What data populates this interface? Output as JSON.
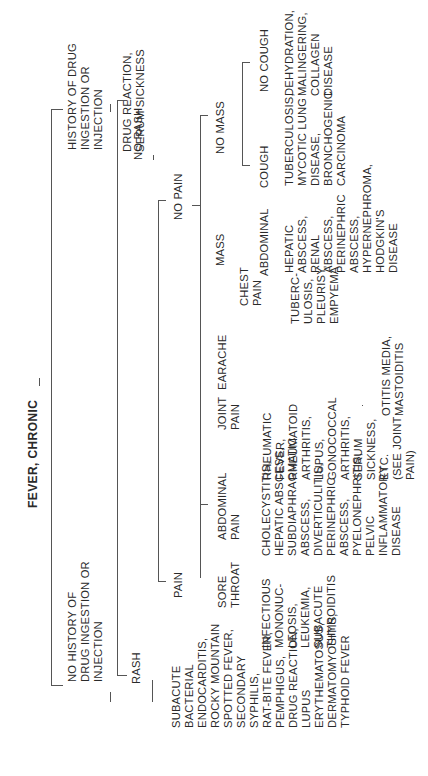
{
  "diagram": {
    "title": "FEVER, CHRONIC",
    "orientation": "rotated 90° counter-clockwise (tree reads left-to-right when page is turned)",
    "tree": {
      "label": "FEVER, CHRONIC",
      "children": [
        {
          "label": "HISTORY OF DRUG INGESTION OR INJECTION",
          "children": [
            {
              "label": "DRUG REACTION, SERUM SICKNESS"
            }
          ]
        },
        {
          "label": "NO HISTORY OF DRUG INGESTION OR INJECTION",
          "children": [
            {
              "label": "NO RASH",
              "children": [
                {
                  "label": "NO PAIN",
                  "children": [
                    {
                      "label": "NO MASS",
                      "children": [
                        {
                          "label": "NO COUGH",
                          "children": [
                            {
                              "label": "DEHYDRATION, MALINGERING, COLLAGEN DISEASE"
                            }
                          ]
                        },
                        {
                          "label": "COUGH",
                          "children": [
                            {
                              "label": "TUBERCULOSIS, MYCOTIC LUNG DISEASE, BRONCHOGENIC CARCINOMA"
                            }
                          ]
                        }
                      ]
                    },
                    {
                      "label": "MASS",
                      "children": [
                        {
                          "label": "ABDOMINAL",
                          "children": [
                            {
                              "label": "HEPATIC ABSCESS, RENAL ABSCESS, PERINEPHRIC ABSCESS, HYPERNEPHROMA, HODGKIN'S DISEASE"
                            }
                          ]
                        }
                      ]
                    }
                  ]
                },
                {
                  "label": "PAIN",
                  "children": [
                    {
                      "label": "CHEST PAIN",
                      "children": [
                        {
                          "label": "TUBERCULOSIS, PLEURISY, EMPYEMA"
                        }
                      ]
                    },
                    {
                      "label": "EARACHE",
                      "children": [
                        {
                          "label": "OTITIS MEDIA, MASTOIDITIS"
                        }
                      ]
                    },
                    {
                      "label": "JOINT PAIN",
                      "children": [
                        {
                          "label": "RHEUMATIC FEVER, RHEUMATOID ARTHRITIS, LUPUS, GONOCOCCAL ARTHRITIS, SERUM SICKNESS, ETC. (SEE JOINT PAIN)"
                        }
                      ]
                    },
                    {
                      "label": "ABDOMINAL PAIN",
                      "children": [
                        {
                          "label": "CHOLECYSTITIS, HEPATIC ABSCESS, SUBDIAPHRAGMATIC ABSCESS, DIVERTICULITIS, PERINEPHRIC ABSCESS, PYELONEPHRITIS, PELVIC INFLAMMATORY DISEASE"
                        }
                      ]
                    },
                    {
                      "label": "SORE THROAT",
                      "children": [
                        {
                          "label": "INFECTIOUS MONONUCLEOSIS, LEUKEMIA, SUBACUTE THYROIDITIS"
                        }
                      ]
                    }
                  ]
                }
              ]
            },
            {
              "label": "RASH",
              "children": [
                {
                  "label": "SUBACUTE BACTERIAL ENDOCARDITIS, ROCKY MOUNTAIN SPOTTED FEVER, SECONDARY SYPHILIS, RAT-BITE FEVER, PEMPHIGUS, DRUG REACTION, LUPUS ERYTHEMATOSUS, DERMATOMYOSITIS, TYPHOID FEVER"
                }
              ]
            }
          ]
        }
      ]
    }
  },
  "labels": {
    "root": "FEVER, CHRONIC",
    "history": "HISTORY OF DRUG\nINGESTION OR\nINJECTION",
    "history_dx": "DRUG REACTION,\nSERUM SICKNESS",
    "no_history": "NO HISTORY OF\nDRUG INGESTION OR\nINJECTION",
    "no_rash": "NO RASH",
    "rash": "RASH",
    "rash_dx": "SUBACUTE\nBACTERIAL\nENDOCARDITIS,\nROCKY MOUNTAIN\nSPOTTED FEVER,\nSECONDARY\nSYPHILIS,\nRAT-BITE FEVER,\nPEMPHIGUS,\nDRUG REACTION,\nLUPUS\nERYTHEMATOSUS,\nDERMATOMYOSITIS,\nTYPHOID FEVER",
    "no_pain": "NO PAIN",
    "pain": "PAIN",
    "no_mass": "NO MASS",
    "mass": "MASS",
    "no_cough": "NO COUGH",
    "no_cough_dx": "DEHYDRATION,\nMALINGERING,\nCOLLAGEN\nDISEASE",
    "cough": "COUGH",
    "cough_dx": "TUBERCULOSIS,\nMYCOTIC LUNG\nDISEASE,\nBRONCHOGENIC\nCARCINOMA",
    "abdominal": "ABDOMINAL",
    "abdominal_dx": "HEPATIC\nABSCESS,\nRENAL\nABSCESS,\nPERINEPHRIC\nABSCESS,\nHYPERNEPHROMA,\nHODGKIN'S\nDISEASE",
    "chest_pain": "CHEST\nPAIN",
    "chest_pain_dx": "TUBERC-\nULOSIS,\nPLEURISY,\nEMPYEMA",
    "earache": "EARACHE",
    "earache_dx": "OTITIS MEDIA,\nMASTOIDITIS",
    "joint_pain": "JOINT\nPAIN",
    "joint_pain_dx": "RHEUMATIC\nFEVER,\nRHEUMATOID\nARTHRITIS,\nLUPUS,\nGONOCOCCAL\nARTHRITIS,\nSERUM\nSICKNESS,\nETC.\n(SEE JOINT\nPAIN)",
    "abdominal_pain": "ABDOMINAL\nPAIN",
    "abdominal_pain_dx": "CHOLECYSTITIS,\nHEPATIC ABSCESS,\nSUBDIAPHRAGMATIC\nABSCESS,\nDIVERTICULITIS,\nPERINEPHRIC\nABSCESS,\nPYELONEPHRITIS,\nPELVIC\nINFLAMMATORY\nDISEASE",
    "sore_throat": "SORE\nTHROAT",
    "sore_throat_dx": "INFECTIOUS\nMONONUC-\nLEOSIS,\nLEUKEMIA,\nSUBACUTE\nTHYROIDITIS"
  }
}
